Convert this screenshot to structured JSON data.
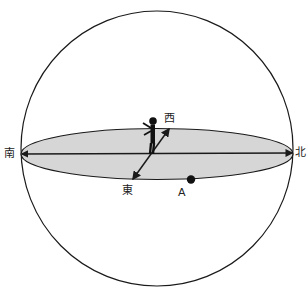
{
  "diagram": {
    "labels": {
      "south": "南",
      "north": "北",
      "west": "西",
      "east": "東",
      "point_a": "A"
    },
    "colors": {
      "horizon_fill": "#d6d6d6",
      "stroke": "#1a1a1a"
    }
  }
}
